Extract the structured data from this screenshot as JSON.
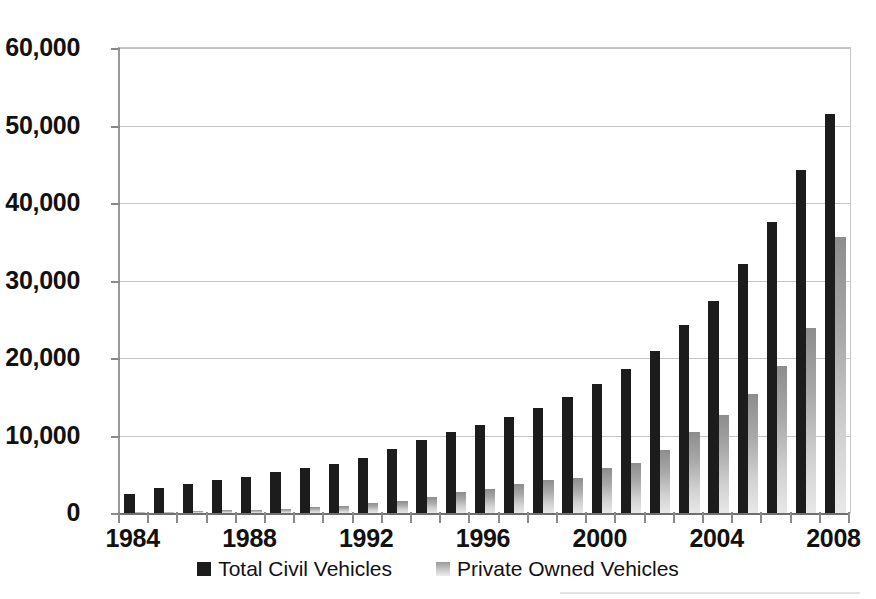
{
  "chart_data": {
    "type": "bar",
    "title": "",
    "subtitle": "",
    "xlabel": "",
    "ylabel": "",
    "grid": true,
    "legend_position": "bottom",
    "ylim": [
      0,
      60000
    ],
    "ytick_values": [
      0,
      10000,
      20000,
      30000,
      40000,
      50000,
      60000
    ],
    "ytick_labels": [
      "0",
      "10,000",
      "20,000",
      "30,000",
      "40,000",
      "50,000",
      "60,000"
    ],
    "categories": [
      "1984",
      "1985",
      "1986",
      "1987",
      "1988",
      "1989",
      "1990",
      "1991",
      "1992",
      "1993",
      "1994",
      "1995",
      "1996",
      "1997",
      "1998",
      "1999",
      "2000",
      "2001",
      "2002",
      "2003",
      "2004",
      "2005",
      "2006",
      "2007",
      "2008"
    ],
    "xtick_labels_shown": [
      "1984",
      "1988",
      "1992",
      "1996",
      "2000",
      "2004",
      "2008"
    ],
    "series": [
      {
        "name": "Total Civil Vehicles",
        "color": "#1c1c1c",
        "values": [
          2450,
          3200,
          3700,
          4200,
          4700,
          5250,
          5800,
          6300,
          7150,
          8200,
          9400,
          10450,
          11350,
          12450,
          13550,
          15000,
          16700,
          18600,
          20900,
          24300,
          27400,
          32100,
          37500,
          44200,
          51500
        ]
      },
      {
        "name": "Private Owned Vehicles",
        "color": "#c0c0c0",
        "values": [
          120,
          180,
          250,
          330,
          450,
          570,
          720,
          950,
          1250,
          1600,
          2100,
          2700,
          3050,
          3700,
          4250,
          4550,
          5800,
          6500,
          8100,
          10400,
          12700,
          15300,
          19000,
          23900,
          35600
        ]
      }
    ]
  },
  "legend": {
    "items": [
      {
        "label": "Total Civil Vehicles",
        "marker": "square-dark"
      },
      {
        "label": "Private Owned Vehicles",
        "marker": "square-light"
      }
    ]
  }
}
